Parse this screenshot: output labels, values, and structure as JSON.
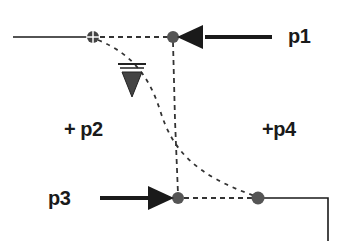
{
  "diagram": {
    "labels": {
      "p1": "p1",
      "p2": "+ p2",
      "p3": "p3",
      "p4": "+p4"
    },
    "colors": {
      "ink": "#1a1a1a",
      "node_fill": "#555555",
      "background": "#ffffff"
    },
    "nodes": [
      {
        "id": "open-node",
        "x": 93,
        "y": 37,
        "style": "crosshair-circle"
      },
      {
        "id": "top-node",
        "x": 173,
        "y": 37,
        "style": "filled"
      },
      {
        "id": "bottom-left-node",
        "x": 178,
        "y": 198,
        "style": "filled"
      },
      {
        "id": "bottom-right-node",
        "x": 258,
        "y": 198,
        "style": "filled"
      }
    ],
    "arrows": [
      {
        "id": "p1-arrow",
        "from": [
          272,
          37
        ],
        "to": [
          178,
          37
        ],
        "label": "p1"
      },
      {
        "id": "p3-arrow",
        "from": [
          100,
          198
        ],
        "to": [
          174,
          198
        ],
        "label": "p3"
      }
    ],
    "water_level_symbol": {
      "x": 130,
      "y": 65
    }
  }
}
